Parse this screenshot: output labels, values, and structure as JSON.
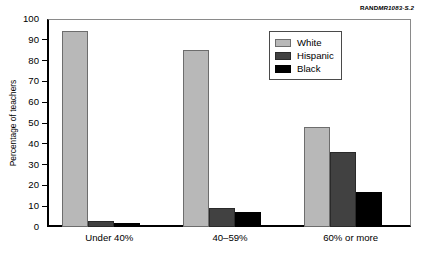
{
  "source_label": {
    "prefix": "RAND",
    "code": "MR1083-S.2"
  },
  "chart_data": {
    "type": "bar",
    "title": "",
    "xlabel": "",
    "ylabel": "Percentage of teachers",
    "ylim": [
      0,
      100
    ],
    "ytick_step": 10,
    "yticks": [
      "100",
      "90",
      "80",
      "70",
      "60",
      "50",
      "40",
      "30",
      "20",
      "10",
      "0"
    ],
    "grid": false,
    "legend_position": "upper right",
    "categories": [
      "Under 40%",
      "40–59%",
      "60% or more"
    ],
    "series": [
      {
        "name": "White",
        "color": "#b8b8b8",
        "values": [
          94,
          85,
          48
        ]
      },
      {
        "name": "Hispanic",
        "color": "#414141",
        "values": [
          3,
          9,
          36
        ]
      },
      {
        "name": "Black",
        "color": "#000000",
        "values": [
          2,
          7,
          17
        ]
      }
    ]
  }
}
